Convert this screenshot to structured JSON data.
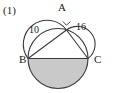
{
  "figure": {
    "index_label": "(1)",
    "vertices": [
      {
        "name": "A",
        "label": "A"
      },
      {
        "name": "B",
        "label": "B"
      },
      {
        "name": "C",
        "label": "C"
      }
    ],
    "segment_labels": [
      {
        "name": "AB",
        "label": "10"
      },
      {
        "name": "AC",
        "label": "16"
      }
    ],
    "marks": [
      {
        "name": "right-angle-at-A",
        "type": "right-angle"
      }
    ],
    "colors": {
      "stroke": "#3a3a3a",
      "shaded_fill": "#c9c9c9",
      "text": "#1a1a1a",
      "background": "#ffffff"
    },
    "geometry": {
      "main_circle": {
        "cx": 58,
        "cy": 58.5,
        "r": 30
      },
      "point_a": {
        "x": 66.5,
        "y": 30.0
      },
      "point_b": {
        "x": 28,
        "y": 58.5
      },
      "point_c": {
        "x": 88,
        "y": 58.5
      },
      "shaded_region": "lower-semicircle-of-main-circle",
      "outward_arcs": [
        "semicircle-on-AB",
        "semicircle-on-AC"
      ]
    }
  }
}
